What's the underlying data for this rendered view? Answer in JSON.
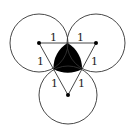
{
  "diagram": {
    "type": "three-tangent-circles",
    "colors": {
      "stroke": "#333333",
      "fill_region": "#000000",
      "background": "#ffffff"
    },
    "circles": [
      {
        "id": "left",
        "cx": 39,
        "cy": 43,
        "r": 29
      },
      {
        "id": "right",
        "cx": 96,
        "cy": 43,
        "r": 29
      },
      {
        "id": "bottom",
        "cx": 68,
        "cy": 95,
        "r": 29
      }
    ],
    "labels": {
      "top_left": "1",
      "top_right": "1",
      "left_upper": "1",
      "right_upper": "1",
      "left_lower": "1",
      "right_lower": "1"
    },
    "shaded_region": "curvilinear triangle between the three circles"
  }
}
